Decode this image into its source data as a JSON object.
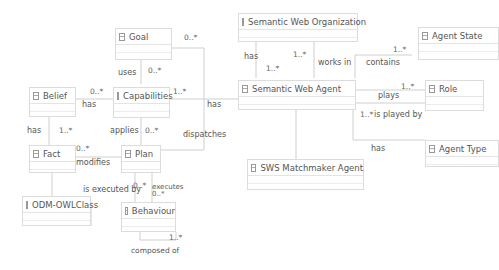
{
  "diagram": {
    "type": "uml-class-diagram",
    "classes": {
      "goal": "Goal",
      "capabilities": "Capabilities",
      "belief": "Belief",
      "fact": "Fact",
      "plan": "Plan",
      "odm": "ODM-OWLClass",
      "behaviour": "Behaviour",
      "swo": "Semantic Web Organization",
      "swa": "Semantic Web Agent",
      "agent_state": "Agent State",
      "role": "Role",
      "agent_type": "Agent Type",
      "sws_matchmaker": "SWS Matchmaker Agent"
    },
    "associations": {
      "uses": "uses",
      "belief_has": "has",
      "fact_has": "has",
      "applies": "applies",
      "modifies": "modifies",
      "dispatches": "dispatches",
      "is_executed_by": "is executed by",
      "executes": "executes",
      "composed_of": "composed of",
      "swa_has_cap": "has",
      "swo_has": "has",
      "works_in": "works in",
      "contains": "contains",
      "plays": "plays",
      "is_played_by": "is played by",
      "type_has": "has"
    },
    "multiplicities": {
      "goal_top": "0..*",
      "uses": "0..*",
      "belief_cap": "0..*",
      "cap_right": "1..*",
      "fact_has": "1..*",
      "fact_mod": "0..*",
      "applies": "0..*",
      "plan_exec": "0..*",
      "executes": "0..*",
      "composed": "1..*",
      "swo_right": "1..*",
      "swa_top": "1..*",
      "agent_state": "1..*",
      "role": "1..*",
      "played_by": "1..*"
    }
  }
}
